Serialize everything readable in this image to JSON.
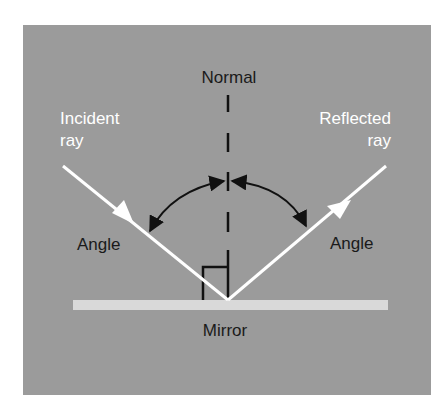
{
  "diagram": {
    "labels": {
      "normal": "Normal",
      "incident_line1": "Incident",
      "incident_line2": "ray",
      "reflected_line1": "Reflected",
      "reflected_line2": "ray",
      "angle_left": "Angle",
      "angle_right": "Angle",
      "mirror": "Mirror"
    },
    "colors": {
      "background": "#9b9b9b",
      "mirror": "#d9d9d9",
      "rays": "#ffffff",
      "lines": "#111111",
      "dark_text": "#1a1a1a",
      "light_text": "#ffffff"
    }
  }
}
